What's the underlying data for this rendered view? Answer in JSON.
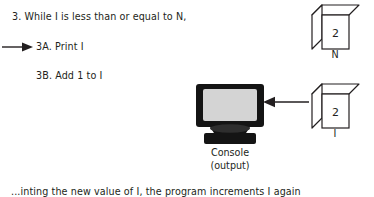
{
  "pseudocode": {
    "while_line": "3. While I is less than or equal to N,",
    "print_line": "3A. Print I",
    "add_line": "3B. Add 1 to I"
  },
  "caption": {
    "text": "...inting the new value of I, the program increments I again"
  },
  "variables": {
    "n": {
      "value": "2",
      "label": "N"
    },
    "i": {
      "value": "2",
      "label": "I"
    }
  },
  "console": {
    "label_line1": "Console",
    "label_line2": "(output)"
  },
  "icons": {
    "left_arrow": "arrow-right-icon",
    "right_arrow": "arrow-left-icon",
    "monitor": "crt-monitor-icon",
    "cube": "cube-icon"
  },
  "colors": {
    "ink": "#231f20",
    "monitor_body": "#1a1a1a",
    "monitor_screen": "#d4d4d4",
    "cube_stroke": "#231f20",
    "paper": "#ffffff"
  }
}
